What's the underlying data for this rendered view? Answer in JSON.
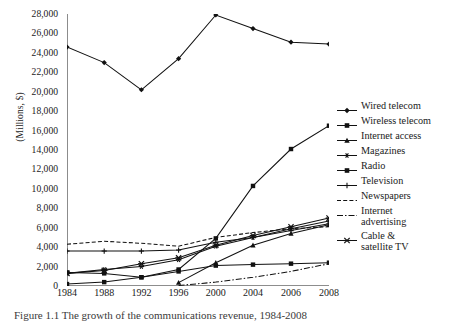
{
  "axes": {
    "ylabel": "(Millions, $)",
    "yticks": [
      "0",
      "2,000",
      "4,000",
      "6,000",
      "8,000",
      "10,000",
      "12,000",
      "14,000",
      "16,000",
      "18,000",
      "20,000",
      "22,000",
      "24,000",
      "26,000",
      "28,000"
    ],
    "ymin": 0,
    "ymax": 28000,
    "ystep": 2000,
    "xticks": [
      "1984",
      "1988",
      "1992",
      "1996",
      "2000",
      "2004",
      "2006",
      "2008"
    ]
  },
  "caption": "Figure 1.1  The growth of the communications revenue, 1984-2008",
  "legend": {
    "items": [
      {
        "label": "Wired telecom",
        "marker": "diamond"
      },
      {
        "label": "Wireless telecom",
        "marker": "square"
      },
      {
        "label": "Internet access",
        "marker": "triangle"
      },
      {
        "label": "Magazines",
        "marker": "asterisk"
      },
      {
        "label": "Radio",
        "marker": "filled-square"
      },
      {
        "label": "Television",
        "marker": "plus"
      },
      {
        "label": "Newspapers",
        "marker": "dashed"
      },
      {
        "label": "Internet\nadvertising",
        "marker": "dashdot"
      },
      {
        "label": "Cable &\nsatellite TV",
        "marker": "x-marker"
      }
    ]
  },
  "chart_data": {
    "type": "line",
    "title": "",
    "xlabel": "",
    "ylabel": "(Millions, $)",
    "x": [
      "1984",
      "1988",
      "1992",
      "1996",
      "2000",
      "2004",
      "2006",
      "2008"
    ],
    "ylim": [
      0,
      28000
    ],
    "ytick_step": 2000,
    "grid": false,
    "legend_position": "right",
    "series": [
      {
        "name": "Wired telecom",
        "marker": "diamond",
        "linestyle": "solid",
        "values": [
          24600,
          23000,
          20200,
          23400,
          27900,
          26500,
          25100,
          24900
        ]
      },
      {
        "name": "Wireless telecom",
        "marker": "square",
        "linestyle": "solid",
        "values": [
          200,
          400,
          900,
          1700,
          4900,
          10300,
          14100,
          16500
        ]
      },
      {
        "name": "Internet access",
        "marker": "triangle",
        "linestyle": "solid",
        "values": [
          null,
          null,
          null,
          350,
          2400,
          4200,
          5400,
          6300
        ]
      },
      {
        "name": "Magazines",
        "marker": "asterisk",
        "linestyle": "solid",
        "values": [
          1300,
          1700,
          2000,
          2700,
          4100,
          5000,
          5900,
          6700
        ]
      },
      {
        "name": "Radio",
        "marker": "filled-square",
        "linestyle": "solid",
        "values": [
          1400,
          1300,
          900,
          1500,
          2100,
          2200,
          2300,
          2400
        ]
      },
      {
        "name": "Television",
        "marker": "plus",
        "linestyle": "solid",
        "values": [
          3600,
          3600,
          3600,
          3700,
          4500,
          5000,
          5700,
          6400
        ]
      },
      {
        "name": "Newspapers",
        "marker": "none",
        "linestyle": "dashed",
        "values": [
          4300,
          4600,
          4400,
          4100,
          5000,
          5500,
          5900,
          6100
        ]
      },
      {
        "name": "Internet advertising",
        "marker": "none",
        "linestyle": "dashdot",
        "values": [
          null,
          null,
          null,
          50,
          400,
          900,
          1500,
          2300
        ]
      },
      {
        "name": "Cable & satellite TV",
        "marker": "x",
        "linestyle": "solid",
        "values": [
          1300,
          1600,
          2300,
          2900,
          4200,
          5200,
          6100,
          7000
        ]
      }
    ]
  }
}
